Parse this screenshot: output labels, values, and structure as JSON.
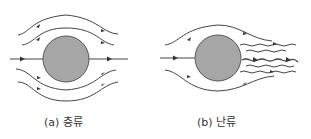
{
  "figure": {
    "panels": [
      {
        "id": "a",
        "caption": "(a) 층류",
        "flow_type": "laminar",
        "obstacle_color": "#a6a6a6"
      },
      {
        "id": "b",
        "caption": "(b) 난류",
        "flow_type": "turbulent",
        "obstacle_color": "#a6a6a6"
      }
    ],
    "colors": {
      "streamline": "#333333",
      "obstacle_fill": "#a6a6a6",
      "obstacle_stroke": "#555555"
    }
  }
}
